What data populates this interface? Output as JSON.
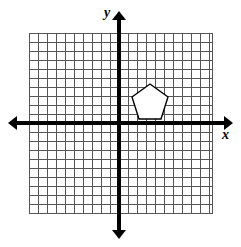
{
  "figure": {
    "kind": "coordinate-plane-with-polygon",
    "background_color": "#ffffff",
    "axis_color": "#000000",
    "grid_color": "#555555",
    "shape_fill": "#ffffff",
    "shape_stroke": "#000000"
  },
  "labels": {
    "x_axis": "x",
    "y_axis": "y"
  },
  "chart_data": {
    "type": "scatter",
    "title": "",
    "xlabel": "x",
    "ylabel": "y",
    "grid": true,
    "legend": null,
    "xlim": [
      -10,
      11
    ],
    "ylim": [
      -10,
      11
    ],
    "grid_step": 1,
    "tick_labels_x": [],
    "tick_labels_y": [],
    "origin_px": {
      "x": 119,
      "y": 123
    },
    "cell_px": 9,
    "grid_bounds_px": {
      "left": 29,
      "top": 33,
      "right": 212,
      "bottom": 213
    },
    "axes": {
      "x": {
        "start_px": 8,
        "end_px": 233,
        "y_px": 123,
        "arrows": [
          "left",
          "right"
        ],
        "width_px": 4
      },
      "y": {
        "start_px": 11,
        "end_px": 239,
        "x_px": 119,
        "arrows": [
          "up",
          "down"
        ],
        "width_px": 4
      }
    },
    "annotations": [
      {
        "name": "pentagon",
        "type": "polygon",
        "sides": 5,
        "quadrant": 1,
        "fill": "#ffffff",
        "stroke": "#000000",
        "vertices_units": [
          [
            3.4,
            4.3
          ],
          [
            5.4,
            2.9
          ],
          [
            4.6,
            0.4
          ],
          [
            2.2,
            0.4
          ],
          [
            1.4,
            2.9
          ]
        ],
        "vertices_px": [
          [
            150,
            84
          ],
          [
            168,
            97
          ],
          [
            161,
            119
          ],
          [
            139,
            119
          ],
          [
            132,
            97
          ]
        ]
      }
    ]
  }
}
